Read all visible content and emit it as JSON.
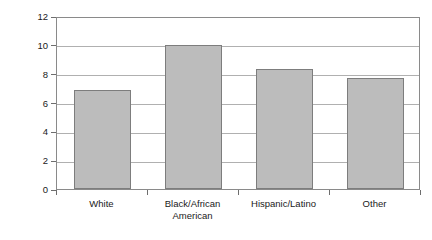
{
  "chart_data": {
    "type": "bar",
    "title": "",
    "subtitle": "",
    "xlabel": "",
    "ylabel": "Rate per 1,000 in the population",
    "categories": [
      "White",
      "Black/African American",
      "Hispanic/Latino",
      "Other"
    ],
    "category_lines": [
      [
        "White"
      ],
      [
        "Black/African",
        "American"
      ],
      [
        "Hispanic/Latino"
      ],
      [
        "Other"
      ]
    ],
    "values": [
      6.9,
      10.0,
      8.3,
      7.7
    ],
    "ylim": [
      0,
      12
    ],
    "y_ticks": [
      0,
      2,
      4,
      6,
      8,
      10,
      12
    ],
    "y_tick_labels": [
      "0",
      "2",
      "4",
      "6",
      "8",
      "10",
      "12"
    ],
    "grid": true,
    "grid_axis": "y",
    "legend": false,
    "legend_position": "none",
    "bar_fill_color": "#bcbcbc",
    "bar_border_color": "#7d7d7d",
    "grid_color": "#b0b0b0",
    "frame_color": "#8a8a8a",
    "background_color": "#ffffff",
    "text_color": "#1a1a1a"
  }
}
